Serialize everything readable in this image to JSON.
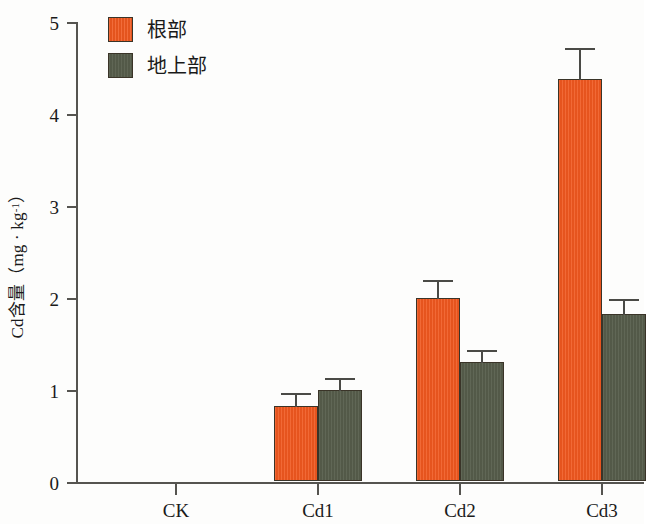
{
  "chart_data": {
    "type": "bar",
    "title": "",
    "xlabel": "",
    "ylabel_parts": {
      "prefix": "Cd含量（mg · kg",
      "exponent": "-1",
      "suffix": "）"
    },
    "ylabel": "Cd含量（mg · kg-1）",
    "categories": [
      "CK",
      "Cd1",
      "Cd2",
      "Cd3"
    ],
    "ylim": [
      0,
      5
    ],
    "ytick_labels": [
      "0",
      "1",
      "2",
      "3",
      "4",
      "5"
    ],
    "ytick_values": [
      0,
      1,
      2,
      3,
      4,
      5
    ],
    "grid": false,
    "legend_position": "top-left",
    "series": [
      {
        "name": "根部",
        "color": "#f0581f",
        "values": [
          0,
          0.81,
          1.99,
          4.37
        ],
        "errors": [
          0,
          0.16,
          0.21,
          0.35
        ]
      },
      {
        "name": "地上部",
        "color": "#575e4c",
        "values": [
          0,
          0.99,
          1.29,
          1.81
        ],
        "errors": [
          0,
          0.14,
          0.15,
          0.18
        ]
      }
    ]
  },
  "legend": {
    "items": [
      {
        "label": "根部",
        "swatch": "root"
      },
      {
        "label": "地上部",
        "swatch": "shoot"
      }
    ]
  },
  "axes": {
    "y": {
      "ticks": [
        "0",
        "1",
        "2",
        "3",
        "4",
        "5"
      ]
    },
    "x": {
      "ticks": [
        "CK",
        "Cd1",
        "Cd2",
        "Cd3"
      ]
    }
  }
}
